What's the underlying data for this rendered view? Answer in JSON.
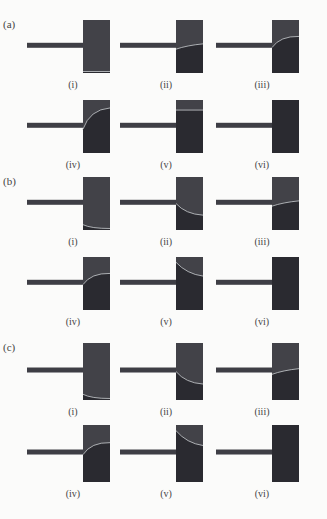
{
  "figure": {
    "colors": {
      "background": "#fbfbfa",
      "bar": "#3e3e45",
      "block_upper": "#424248",
      "block_lower": "#2a2a30",
      "interface_line": "#b9bcc0",
      "label_text": "#444444"
    },
    "sections": [
      {
        "label": "(a)",
        "panels": [
          {
            "label": "(i)",
            "interface": "bottom-flat"
          },
          {
            "label": "(ii)",
            "interface": "slight-rise"
          },
          {
            "label": "(iii)",
            "interface": "curve-up"
          },
          {
            "label": "(iv)",
            "interface": "curve-up-high"
          },
          {
            "label": "(v)",
            "interface": "top-flat"
          },
          {
            "label": "(vi)",
            "interface": "none"
          }
        ]
      },
      {
        "label": "(b)",
        "panels": [
          {
            "label": "(i)",
            "interface": "bottom-corner"
          },
          {
            "label": "(ii)",
            "interface": "curve-down"
          },
          {
            "label": "(iii)",
            "interface": "slight-rise"
          },
          {
            "label": "(iv)",
            "interface": "curve-up"
          },
          {
            "label": "(v)",
            "interface": "curve-down-high"
          },
          {
            "label": "(vi)",
            "interface": "none"
          }
        ]
      },
      {
        "label": "(c)",
        "panels": [
          {
            "label": "(i)",
            "interface": "bottom-corner"
          },
          {
            "label": "(ii)",
            "interface": "curve-down"
          },
          {
            "label": "(iii)",
            "interface": "slight-rise"
          },
          {
            "label": "(iv)",
            "interface": "curve-up"
          },
          {
            "label": "(v)",
            "interface": "curve-down-high"
          },
          {
            "label": "(vi)",
            "interface": "none"
          }
        ]
      }
    ]
  }
}
